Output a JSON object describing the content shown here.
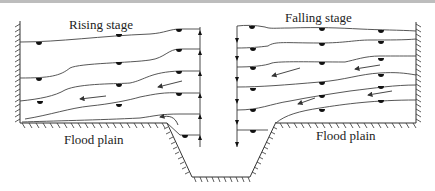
{
  "diagram": {
    "title_left": "Rising stage",
    "title_right": "Falling stage",
    "floodplain_left": "Flood plain",
    "floodplain_right": "Flood plain",
    "elements": {
      "left_panel": "Rising stage: isolines on flood plain with floats, flow arrows pointing toward left, upward arrows on channel boundary",
      "right_panel": "Falling stage: isolines on flood plain with floats, flow arrows pointing toward left, downward arrows on channel boundary",
      "channel": "Trapezoidal main channel between the two flood plains"
    },
    "colors": {
      "line": "#444444",
      "float": "#111111",
      "background": "#ffffff",
      "top_border": "#bdbdbd"
    }
  }
}
